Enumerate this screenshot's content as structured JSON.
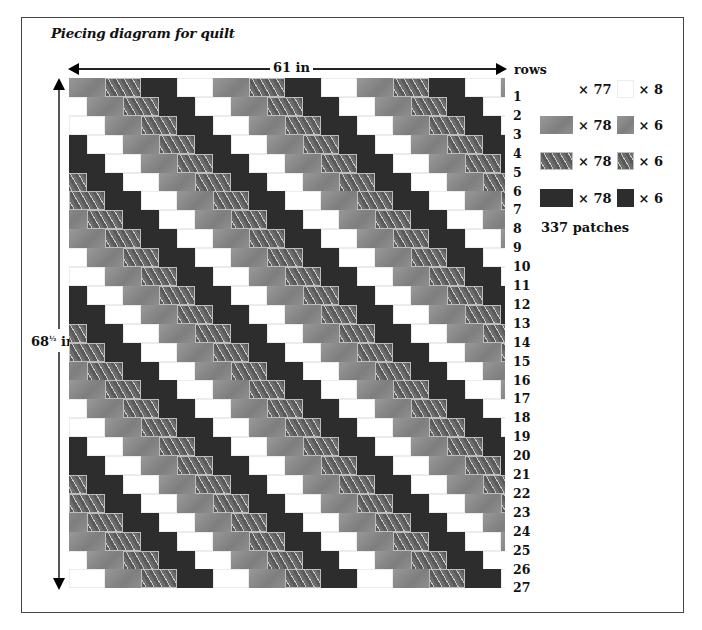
{
  "title": "Piecing diagram for quilt",
  "dimensions": {
    "width_label": "61 in",
    "height_label_main": "68",
    "height_label_fraction": "½",
    "height_label_unit": "in"
  },
  "rows_header": "rows",
  "row_labels": [
    "1",
    "2",
    "3",
    "4",
    "5",
    "6",
    "7",
    "8",
    "9",
    "10",
    "11",
    "12",
    "13",
    "14",
    "15",
    "16",
    "17",
    "18",
    "19",
    "20",
    "21",
    "22",
    "23",
    "24",
    "25",
    "26",
    "27"
  ],
  "quilt": {
    "row_count": 27,
    "patch_width_px": 36,
    "row_height_px": 18.9,
    "row_shift_px": 18,
    "band_sequence": [
      "gray",
      "pattern",
      "dark",
      "white"
    ],
    "colors": {
      "gray": "#8c8c8c",
      "pattern": "#6a6a6a",
      "dark": "#2d2d2d",
      "white": "#ffffff"
    }
  },
  "legend": {
    "items": [
      {
        "type": "white",
        "full_count": "× 77",
        "half_count": "× 8"
      },
      {
        "type": "gray",
        "full_count": "× 78",
        "half_count": "× 6"
      },
      {
        "type": "pattern",
        "full_count": "× 78",
        "half_count": "× 6"
      },
      {
        "type": "dark",
        "full_count": "× 78",
        "half_count": "× 6"
      }
    ],
    "total": "337 patches"
  }
}
